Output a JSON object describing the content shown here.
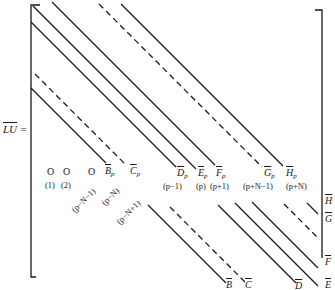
{
  "equation_lhs": "LU =",
  "matrix": {
    "upper_labels": [
      {
        "id": "Bp",
        "text": "B",
        "sub": "p",
        "index": "(p−N)"
      },
      {
        "id": "Cp",
        "text": "C",
        "sub": "p",
        "index": "(p−N+1)"
      },
      {
        "id": "Dp",
        "text": "D",
        "sub": "p",
        "index": "(p−1)"
      },
      {
        "id": "Ep",
        "text": "E",
        "sub": "p",
        "index": "(p)"
      },
      {
        "id": "Fp",
        "text": "F",
        "sub": "p",
        "index": "(p+1)"
      },
      {
        "id": "Gp",
        "text": "G",
        "sub": "p",
        "index": "(p+N−1)"
      },
      {
        "id": "Hp",
        "text": "H",
        "sub": "p",
        "index": "(p+N)"
      }
    ],
    "zeros": [
      {
        "text": "O",
        "index": "(1)"
      },
      {
        "text": "O",
        "index": "(2)"
      },
      {
        "text": "O",
        "index": "(p−N−1)"
      }
    ],
    "lower_labels": [
      "B",
      "C",
      "D",
      "E"
    ],
    "right_labels": [
      "H",
      "G",
      "F",
      "E"
    ]
  }
}
